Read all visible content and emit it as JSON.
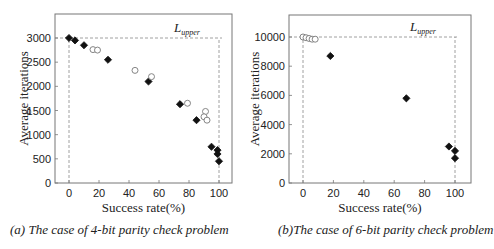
{
  "chart_data": [
    {
      "type": "scatter",
      "title": "(a) The case of 4-bit parity check problem",
      "xlabel": "Success rate(%)",
      "ylabel": "Average iterations",
      "xlim": [
        -10,
        108
      ],
      "ylim": [
        0,
        3450
      ],
      "xticks": [
        0,
        20,
        40,
        60,
        80,
        100
      ],
      "yticks": [
        0,
        500,
        1000,
        1500,
        2000,
        2500,
        3000
      ],
      "annotation": {
        "text": "L",
        "subscript": "upper",
        "y": 3000,
        "x": 100
      },
      "grid": false,
      "series": [
        {
          "name": "filled-diamond",
          "marker": "filled",
          "points": [
            [
              0,
              3000
            ],
            [
              4,
              2950
            ],
            [
              10,
              2850
            ],
            [
              26,
              2550
            ],
            [
              53,
              2100
            ],
            [
              74,
              1630
            ],
            [
              85,
              1300
            ],
            [
              95,
              750
            ],
            [
              99,
              680
            ],
            [
              99,
              600
            ],
            [
              100,
              450
            ]
          ]
        },
        {
          "name": "open-circle",
          "marker": "open",
          "points": [
            [
              16,
              2760
            ],
            [
              19,
              2750
            ],
            [
              44,
              2330
            ],
            [
              55,
              2200
            ],
            [
              79,
              1650
            ],
            [
              91,
              1480
            ],
            [
              90,
              1370
            ],
            [
              92,
              1300
            ]
          ]
        }
      ]
    },
    {
      "type": "scatter",
      "title": "(b)The case of 6-bit parity check problem",
      "xlabel": "Success rate(%)",
      "ylabel": "Average iterations",
      "xlim": [
        -9,
        110
      ],
      "ylim": [
        0,
        11500
      ],
      "xticks": [
        0,
        20,
        40,
        60,
        80,
        100
      ],
      "yticks": [
        0,
        2000,
        4000,
        6000,
        8000,
        10000
      ],
      "annotation": {
        "text": "L",
        "subscript": "upper",
        "y": 10000,
        "x": 100
      },
      "grid": false,
      "series": [
        {
          "name": "filled-diamond",
          "marker": "filled",
          "points": [
            [
              18,
              8700
            ],
            [
              68,
              5800
            ],
            [
              96,
              2500
            ],
            [
              100,
              2200
            ],
            [
              100,
              1700
            ]
          ]
        },
        {
          "name": "open-circle",
          "marker": "open",
          "points": [
            [
              0,
              10000
            ],
            [
              2,
              9950
            ],
            [
              4,
              9900
            ],
            [
              6,
              9850
            ],
            [
              8,
              9850
            ]
          ]
        }
      ]
    }
  ],
  "captions": {
    "a": "(a) The case of 4-bit parity check problem",
    "b": "(b)The case of 6-bit parity check problem"
  },
  "labels": {
    "xlabel": "Success rate(%)",
    "ylabel": "Average iterations",
    "upper_main": "L",
    "upper_sub": "upper"
  }
}
